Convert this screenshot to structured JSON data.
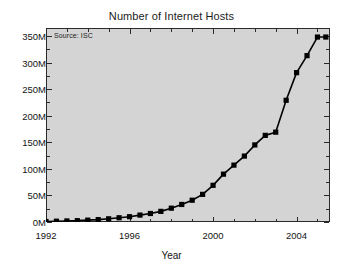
{
  "chart_data": {
    "type": "line",
    "title": "Number of Internet Hosts",
    "xlabel": "Year",
    "ylabel": "",
    "annotation": "Source: ISC",
    "xlim": [
      1992,
      2005.6
    ],
    "ylim": [
      0,
      365
    ],
    "grid": false,
    "legend": null,
    "units": "millions of hosts",
    "x_tick_labels": [
      "1992",
      "1996",
      "2000",
      "2004"
    ],
    "x_tick_values": [
      1992,
      1996,
      2000,
      2004
    ],
    "x_minor_step": 1,
    "y_tick_labels": [
      "0M",
      "50M",
      "100M",
      "150M",
      "200M",
      "250M",
      "300M",
      "350M"
    ],
    "y_tick_values": [
      0,
      50,
      100,
      150,
      200,
      250,
      300,
      350
    ],
    "y_minor_step": 25,
    "series": [
      {
        "name": "Internet hosts",
        "color": "#000000",
        "marker": "square",
        "x": [
          1992.0,
          1992.5,
          1993.0,
          1993.5,
          1994.0,
          1994.5,
          1995.0,
          1995.5,
          1996.0,
          1996.5,
          1997.0,
          1997.5,
          1998.0,
          1998.5,
          1999.0,
          1999.5,
          2000.0,
          2000.5,
          2001.0,
          2001.5,
          2002.0,
          2002.5,
          2003.0,
          2003.5,
          2004.0,
          2004.5,
          2005.0,
          2005.4
        ],
        "values": [
          1,
          1.5,
          2,
          2.5,
          3.5,
          4.5,
          6,
          8,
          10,
          13,
          16,
          20,
          26,
          33,
          41,
          52,
          69,
          90,
          107,
          124,
          145,
          163,
          169,
          229,
          281,
          313,
          348,
          348
        ]
      }
    ]
  },
  "axes": {
    "x_title": "Year",
    "y_title": ""
  },
  "colors": {
    "plot_background": "#d4d4d4",
    "page_background": "#ffffff",
    "frame": "#2a2a2a",
    "series": "#000000",
    "text": "#141414"
  }
}
